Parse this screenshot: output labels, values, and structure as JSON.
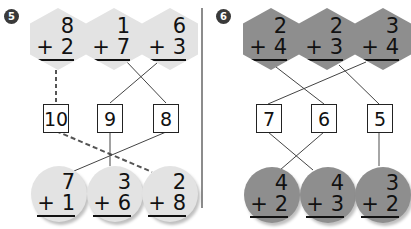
{
  "problem_5": {
    "number": "5",
    "hexagons": [
      {
        "top": "8",
        "bottom": "+ 2"
      },
      {
        "top": "1",
        "bottom": "+ 7"
      },
      {
        "top": "6",
        "bottom": "+ 3"
      }
    ],
    "boxes": [
      "10",
      "9",
      "8"
    ],
    "circles": [
      {
        "top": "7",
        "bottom": "+ 1"
      },
      {
        "top": "3",
        "bottom": "+ 6"
      },
      {
        "top": "2",
        "bottom": "+ 8"
      }
    ],
    "shape_color": "#e3e3e3"
  },
  "problem_6": {
    "number": "6",
    "hexagons": [
      {
        "top": "2",
        "bottom": "+ 4"
      },
      {
        "top": "2",
        "bottom": "+ 3"
      },
      {
        "top": "3",
        "bottom": "+ 4"
      }
    ],
    "boxes": [
      "7",
      "6",
      "5"
    ],
    "circles": [
      {
        "top": "4",
        "bottom": "+ 2"
      },
      {
        "top": "4",
        "bottom": "+ 3"
      },
      {
        "top": "3",
        "bottom": "+ 2"
      }
    ],
    "shape_color": "#8e8e8e"
  }
}
